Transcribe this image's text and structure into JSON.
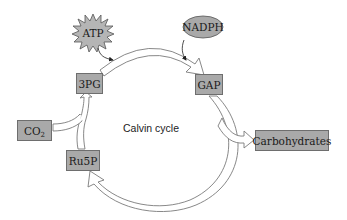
{
  "diagram": {
    "title": "Calvin cycle",
    "center_label": "Calvin cycle",
    "colors": {
      "node_fill": "#a9a9a9",
      "node_border": "#6e6e6e",
      "arrow_stroke": "#7a7a7a",
      "arrow_fill": "#ffffff",
      "background": "#ffffff"
    },
    "nodes": {
      "atp": {
        "label": "ATP",
        "shape": "starburst"
      },
      "nadph": {
        "label": "NADPH",
        "shape": "ellipse"
      },
      "pg3": {
        "label": "3PG",
        "shape": "box"
      },
      "gap": {
        "label": "GAP",
        "shape": "box"
      },
      "co2": {
        "label": "CO",
        "subscript": "2",
        "shape": "box"
      },
      "ru5p": {
        "label": "Ru5P",
        "shape": "box"
      },
      "carbohydrates": {
        "label": "Carbohydrates",
        "shape": "box"
      }
    },
    "edges": [
      {
        "from": "3PG",
        "to": "GAP",
        "style": "hollow-arrow",
        "cofactor": "ATP"
      },
      {
        "from": "GAP",
        "to": "Ru5P",
        "style": "hollow-arrow",
        "cofactor": "NADPH"
      },
      {
        "from": "GAP",
        "to": "Carbohydrates",
        "style": "hollow-arrow-branch"
      },
      {
        "from": "Ru5P",
        "to": "3PG",
        "style": "hollow-arrow-merge",
        "input": "CO2"
      }
    ]
  }
}
